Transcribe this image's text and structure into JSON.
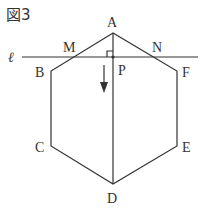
{
  "figure": {
    "title": "図3",
    "line_label": "ℓ",
    "points": {
      "A": {
        "label": "A",
        "x": 113,
        "y": 33
      },
      "B": {
        "label": "B",
        "x": 51,
        "y": 71
      },
      "C": {
        "label": "C",
        "x": 51,
        "y": 146
      },
      "D": {
        "label": "D",
        "x": 113,
        "y": 184
      },
      "E": {
        "label": "E",
        "x": 177,
        "y": 146
      },
      "F": {
        "label": "F",
        "x": 177,
        "y": 71
      },
      "M": {
        "label": "M",
        "x": 74,
        "y": 57
      },
      "N": {
        "label": "N",
        "x": 152,
        "y": 57
      },
      "P": {
        "label": "P",
        "x": 113,
        "y": 57
      }
    },
    "segments": [
      "AB",
      "BC",
      "CD",
      "DE",
      "EF",
      "FA",
      "AD"
    ],
    "line_l": {
      "y": 57,
      "x_start": 22,
      "x_end": 198
    },
    "right_angle_at": "P",
    "arrow": {
      "direction": "down",
      "x": 104,
      "y_start": 65,
      "y_end": 92
    }
  }
}
